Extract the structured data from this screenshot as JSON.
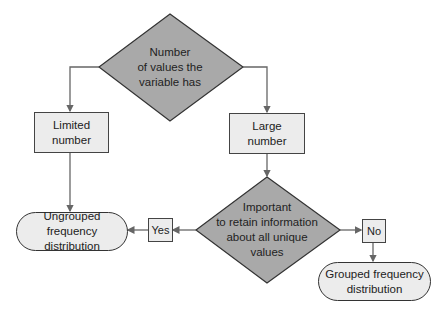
{
  "diagram": {
    "type": "flowchart",
    "nodes": {
      "decision_top": {
        "text": "Number of values the variable has",
        "line1": "Number",
        "line2": "of values the",
        "line3": "variable has"
      },
      "limited": {
        "line1": "Limited",
        "line2": "number"
      },
      "large": {
        "line1": "Large",
        "line2": "number"
      },
      "decision_bottom": {
        "line1": "Important",
        "line2": "to retain information",
        "line3": "about all unique",
        "line4": "values"
      },
      "yes": {
        "label": "Yes"
      },
      "no": {
        "label": "No"
      },
      "ungrouped": {
        "line1": "Ungrouped frequency",
        "line2": "distribution"
      },
      "grouped": {
        "line1": "Grouped frequency",
        "line2": "distribution"
      }
    },
    "edges": [
      {
        "from": "Number of values the variable has",
        "to": "Limited number"
      },
      {
        "from": "Number of values the variable has",
        "to": "Large number"
      },
      {
        "from": "Limited number",
        "to": "Ungrouped frequency distribution"
      },
      {
        "from": "Large number",
        "to": "Important to retain information about all unique values"
      },
      {
        "from": "Important to retain information about all unique values",
        "to": "Ungrouped frequency distribution",
        "label": "Yes"
      },
      {
        "from": "Important to retain information about all unique values",
        "to": "Grouped frequency distribution",
        "label": "No"
      }
    ],
    "colors": {
      "diamond_fill": "#a9a9a9",
      "box_fill": "#ececec",
      "line": "#666666",
      "border": "#444444"
    }
  }
}
